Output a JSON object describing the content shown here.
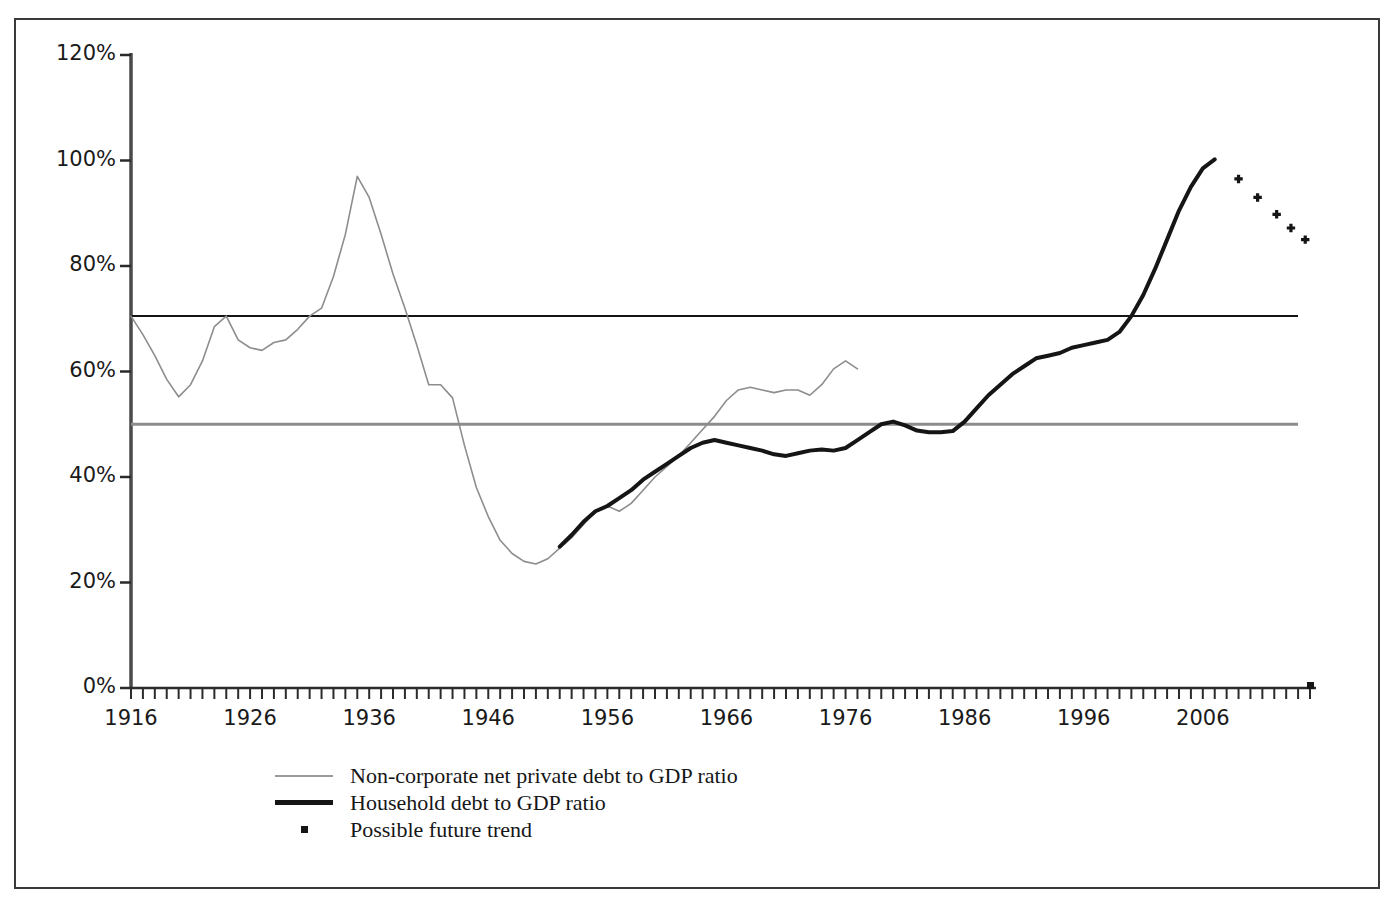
{
  "chart_data": {
    "type": "line",
    "title": "",
    "xlabel": "",
    "ylabel": "",
    "xlim": [
      1916,
      2015
    ],
    "ylim": [
      0,
      120
    ],
    "y_unit": "%",
    "grid": false,
    "legend_position": "bottom-left",
    "y_ticks": [
      "0%",
      "20%",
      "40%",
      "60%",
      "80%",
      "100%",
      "120%"
    ],
    "y_tick_values": [
      0,
      20,
      40,
      60,
      80,
      100,
      120
    ],
    "x_ticks": [
      "1916",
      "1926",
      "1936",
      "1946",
      "1956",
      "1966",
      "1976",
      "1986",
      "1996",
      "2006"
    ],
    "x_tick_values": [
      1916,
      1926,
      1936,
      1946,
      1956,
      1966,
      1976,
      1986,
      1996,
      2006
    ],
    "x_minor_tick_interval": 1,
    "reference_lines": [
      {
        "name": "upper-reference-line",
        "value": 70.5,
        "color": "#151515",
        "width": 2
      },
      {
        "name": "lower-reference-line",
        "value": 50,
        "color": "#8c8c8c",
        "width": 3
      }
    ],
    "series": [
      {
        "name": "Non-corporate net private debt to GDP ratio",
        "type": "line",
        "color": "#8d8d8d",
        "width": 1.6,
        "x": [
          1916,
          1917,
          1918,
          1919,
          1920,
          1921,
          1922,
          1923,
          1924,
          1925,
          1926,
          1927,
          1928,
          1929,
          1930,
          1931,
          1932,
          1933,
          1934,
          1935,
          1936,
          1937,
          1938,
          1939,
          1940,
          1941,
          1942,
          1943,
          1944,
          1945,
          1946,
          1947,
          1948,
          1949,
          1950,
          1951,
          1952,
          1953,
          1954,
          1955,
          1956,
          1957,
          1958,
          1959,
          1960,
          1961,
          1962,
          1963,
          1964,
          1965,
          1966,
          1967,
          1968,
          1969,
          1970,
          1971,
          1972,
          1973,
          1974,
          1975,
          1976,
          1977
        ],
        "y": [
          70.5,
          67.0,
          63.0,
          58.5,
          55.2,
          57.5,
          62.0,
          68.5,
          70.5,
          66.0,
          64.5,
          64.0,
          65.5,
          66.0,
          68.0,
          70.5,
          72.0,
          78.0,
          86.0,
          97.0,
          93.0,
          86.0,
          78.5,
          72.0,
          65.0,
          57.5,
          57.5,
          55.0,
          46.0,
          38.0,
          32.5,
          28.0,
          25.5,
          24.0,
          23.5,
          24.5,
          26.5,
          28.5,
          31.0,
          33.5,
          34.5,
          33.5,
          35.0,
          37.5,
          40.0,
          42.0,
          44.0,
          46.5,
          49.0,
          51.5,
          54.5,
          56.5,
          57.0,
          56.5,
          56.0,
          56.5,
          56.5,
          55.5,
          57.5,
          60.5,
          62.0,
          60.5
        ]
      },
      {
        "name": "Household debt to GDP ratio",
        "type": "line",
        "color": "#151515",
        "width": 4,
        "x": [
          1952,
          1953,
          1954,
          1955,
          1956,
          1957,
          1958,
          1959,
          1960,
          1961,
          1962,
          1963,
          1964,
          1965,
          1966,
          1967,
          1968,
          1969,
          1970,
          1971,
          1972,
          1973,
          1974,
          1975,
          1976,
          1977,
          1978,
          1979,
          1980,
          1981,
          1982,
          1983,
          1984,
          1985,
          1986,
          1987,
          1988,
          1989,
          1990,
          1991,
          1992,
          1993,
          1994,
          1995,
          1996,
          1997,
          1998,
          1999,
          2000,
          2001,
          2002,
          2003,
          2004,
          2005,
          2006,
          2007
        ],
        "y": [
          26.8,
          29.0,
          31.5,
          33.5,
          34.5,
          36.0,
          37.5,
          39.5,
          41.0,
          42.5,
          44.0,
          45.5,
          46.5,
          47.0,
          46.5,
          46.0,
          45.5,
          45.0,
          44.3,
          44.0,
          44.5,
          45.0,
          45.2,
          45.0,
          45.5,
          47.0,
          48.5,
          50.0,
          50.5,
          49.8,
          48.8,
          48.5,
          48.5,
          48.7,
          50.5,
          53.0,
          55.5,
          57.5,
          59.5,
          61.0,
          62.5,
          63.0,
          63.5,
          64.5,
          65.0,
          65.5,
          66.0,
          67.5,
          70.5,
          74.5,
          79.5,
          85.0,
          90.5,
          95.0,
          98.5,
          100.2
        ]
      },
      {
        "name": "Possible future trend",
        "type": "scatter",
        "marker": "dot",
        "color": "#151515",
        "x": [
          2009,
          2010.6,
          2012.2,
          2013.4,
          2014.6
        ],
        "y": [
          96.5,
          93.0,
          89.8,
          87.2,
          85.0
        ]
      }
    ]
  },
  "legend": {
    "items": [
      {
        "key": "line-gray",
        "label": "Non-corporate net private debt to GDP ratio"
      },
      {
        "key": "line-black",
        "label": "Household debt to GDP ratio"
      },
      {
        "key": "dot",
        "label": "Possible future trend"
      }
    ]
  }
}
